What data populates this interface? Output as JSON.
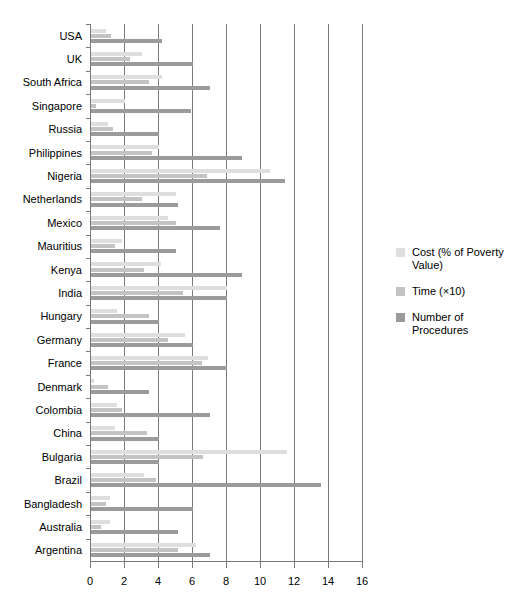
{
  "chart_data": {
    "type": "bar",
    "orientation": "horizontal",
    "title": "",
    "subtitle": "",
    "xlabel": "",
    "ylabel": "",
    "xlim": [
      0,
      16
    ],
    "xticks": [
      0,
      2,
      4,
      6,
      8,
      10,
      12,
      14,
      16
    ],
    "xtick_labels": [
      "0",
      "2",
      "4",
      "6",
      "8",
      "10",
      "12",
      "14",
      "16"
    ],
    "grid": true,
    "grid_axis": "x",
    "legend_position": "right",
    "categories": [
      "USA",
      "UK",
      "South Africa",
      "Singapore",
      "Russia",
      "Philippines",
      "Nigeria",
      "Netherlands",
      "Mexico",
      "Mauritius",
      "Kenya",
      "India",
      "Hungary",
      "Germany",
      "France",
      "Denmark",
      "Colombia",
      "China",
      "Bulgaria",
      "Brazil",
      "Bangladesh",
      "Australia",
      "Argentina"
    ],
    "series": [
      {
        "name": "Cost (% of Poverty Value)",
        "color": "#dedede",
        "values": [
          0.9,
          3.0,
          4.2,
          2.0,
          1.0,
          4.0,
          10.5,
          5.0,
          4.5,
          1.8,
          4.1,
          8.0,
          1.5,
          5.5,
          6.9,
          0.2,
          1.5,
          1.4,
          11.5,
          3.1,
          1.1,
          1.1,
          6.2
        ]
      },
      {
        "name": "Time (×10)",
        "color": "#c3c3c3",
        "values": [
          1.2,
          2.3,
          3.4,
          0.3,
          1.3,
          3.6,
          6.8,
          3.0,
          5.0,
          1.4,
          3.1,
          5.4,
          3.4,
          4.5,
          6.5,
          1.0,
          1.8,
          3.3,
          6.6,
          3.8,
          0.9,
          0.6,
          5.1
        ]
      },
      {
        "name": "Number of Procedures",
        "color": "#9b9b9b",
        "values": [
          4.2,
          6.0,
          7.0,
          5.9,
          4.0,
          8.9,
          11.4,
          5.1,
          7.6,
          5.0,
          8.9,
          8.0,
          4.0,
          6.0,
          8.0,
          3.4,
          7.0,
          4.0,
          4.0,
          13.5,
          6.0,
          5.1,
          7.0
        ]
      }
    ]
  },
  "legend": {
    "items": [
      {
        "label": "Cost (% of Poverty Value)",
        "color": "#dedede",
        "swatch_name": "legend-swatch-cost"
      },
      {
        "label": "Time (×10)",
        "color": "#c3c3c3",
        "swatch_name": "legend-swatch-time"
      },
      {
        "label": "Number of Procedures",
        "color": "#9b9b9b",
        "swatch_name": "legend-swatch-procedures"
      }
    ]
  }
}
